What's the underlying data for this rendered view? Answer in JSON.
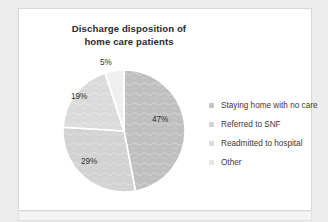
{
  "chart_data": {
    "type": "pie",
    "title": "Discharge disposition of home care patients",
    "title_line1": "Discharge disposition of",
    "title_line2": "home care patients",
    "categories": [
      "Staying home with no care",
      "Referred to SNF",
      "Readmitted to hospital",
      "Other"
    ],
    "values": [
      47,
      29,
      19,
      5
    ],
    "value_labels": [
      "47%",
      "29%",
      "19%",
      "5%"
    ],
    "colors": [
      "#bfbfbf",
      "#d2d2d2",
      "#dadada",
      "#efefef"
    ],
    "unit": "%",
    "legend_position": "right",
    "grid": false,
    "xlabel": "",
    "ylabel": "",
    "slice_order": "clockwise-from-top",
    "separator_color": "#ffffff"
  },
  "slice_labels": [
    {
      "text": "47%",
      "left": 133,
      "top": 108
    },
    {
      "text": "29%",
      "left": 62,
      "top": 150
    },
    {
      "text": "19%",
      "left": 52,
      "top": 85
    },
    {
      "text": "5%",
      "left": 81,
      "top": 51
    }
  ],
  "legend": {
    "items": [
      {
        "label": "Staying home with no care",
        "color": "#c6c6c6"
      },
      {
        "label": "Referred to SNF",
        "color": "#d5d5d5"
      },
      {
        "label": "Readmitted to hospital",
        "color": "#dcdcdc"
      },
      {
        "label": "Other",
        "color": "#e6e6e6"
      }
    ]
  },
  "theme": {
    "page_background": "#ececec",
    "card_background": "#ffffff",
    "card_border": "#d8d8d8",
    "title_color": "#2b2b2b",
    "label_color": "#2f2f2f",
    "legend_text_color": "#3a3a3a"
  }
}
